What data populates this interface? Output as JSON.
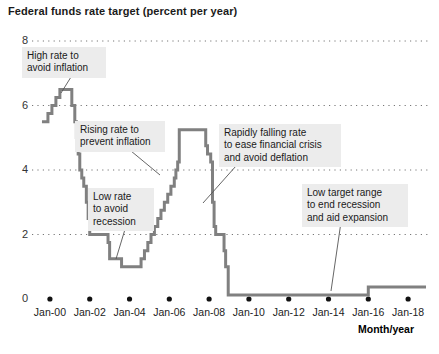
{
  "chart_data": {
    "type": "line",
    "title": "Federal funds rate target (percent per year)",
    "xlabel": "Month/year",
    "ylabel": "",
    "xlim": [
      "Jan-99",
      "Jan-19"
    ],
    "ylim": [
      0,
      8
    ],
    "grid": true,
    "grid_style": "dotted-horizontal",
    "legend": "none",
    "line_color": "#808080",
    "line_width": 3,
    "step": "post",
    "ytick_labels": [
      "0",
      "2",
      "4",
      "6",
      "8"
    ],
    "ytick_values": [
      0,
      2,
      4,
      6,
      8
    ],
    "xtick_labels": [
      "Jan-00",
      "Jan-02",
      "Jan-04",
      "Jan-06",
      "Jan-08",
      "Jan-10",
      "Jan-12",
      "Jan-14",
      "Jan-16",
      "Jan-18"
    ],
    "xtick_values": [
      2000,
      2002,
      2004,
      2006,
      2008,
      2010,
      2012,
      2014,
      2016,
      2018
    ],
    "series": [
      {
        "name": "Federal funds rate target",
        "x": [
          1999.6,
          1999.9,
          2000.1,
          2000.3,
          2000.5,
          2001.0,
          2001.1,
          2001.25,
          2001.33,
          2001.42,
          2001.5,
          2001.6,
          2001.7,
          2001.78,
          2001.83,
          2001.92,
          2002.0,
          2002.92,
          2003.0,
          2003.5,
          2003.6,
          2004.5,
          2004.58,
          2004.75,
          2004.92,
          2005.08,
          2005.25,
          2005.42,
          2005.58,
          2005.75,
          2005.92,
          2006.08,
          2006.25,
          2006.33,
          2006.42,
          2006.5,
          2007.67,
          2007.83,
          2007.92,
          2008.08,
          2008.17,
          2008.25,
          2008.33,
          2008.75,
          2008.83,
          2008.96,
          2015.96,
          2016.0,
          2018.9
        ],
        "y": [
          5.5,
          5.75,
          6.0,
          6.25,
          6.5,
          6.5,
          6.0,
          5.5,
          5.0,
          4.5,
          4.0,
          3.75,
          3.5,
          3.5,
          3.0,
          2.5,
          2.0,
          1.75,
          1.25,
          1.25,
          1.0,
          1.0,
          1.25,
          1.5,
          1.75,
          2.0,
          2.25,
          2.5,
          2.75,
          3.0,
          3.25,
          3.5,
          3.75,
          4.0,
          4.25,
          5.25,
          5.25,
          4.75,
          4.5,
          4.25,
          3.0,
          2.25,
          2.0,
          1.5,
          1.0,
          0.125,
          0.125,
          0.375,
          0.375
        ]
      }
    ],
    "annotations": [
      {
        "id": "high-rate",
        "lines": [
          "High rate to",
          "avoid inflation"
        ],
        "box_x": 22,
        "box_y": 47,
        "box_w": 74,
        "leader_from_x": 71,
        "leader_from_y": 77,
        "leader_to_x": 61,
        "leader_to_y": 93
      },
      {
        "id": "rising-rate",
        "lines": [
          "Rising rate to",
          "prevent inflation"
        ],
        "box_x": 75,
        "box_y": 121,
        "box_w": 80,
        "leader_from_x": 131,
        "leader_from_y": 151,
        "leader_to_x": 160,
        "leader_to_y": 175
      },
      {
        "id": "low-rate",
        "lines": [
          "Low rate",
          "to avoid",
          "recession"
        ],
        "box_x": 88,
        "box_y": 188,
        "box_w": 56,
        "leader_from_x": 126,
        "leader_from_y": 226,
        "leader_to_x": 116,
        "leader_to_y": 259
      },
      {
        "id": "rapidly-falling",
        "lines": [
          "Rapidly falling rate",
          "to ease financial crisis",
          "and avoid deflation"
        ],
        "box_x": 219,
        "box_y": 124,
        "box_w": 112,
        "leader_from_x": 236,
        "leader_from_y": 166,
        "leader_to_x": 203,
        "leader_to_y": 203
      },
      {
        "id": "low-target-range",
        "lines": [
          "Low target range",
          "to end recession",
          "and aid expansion"
        ],
        "box_x": 302,
        "box_y": 184,
        "box_w": 96,
        "leader_from_x": 341,
        "leader_from_y": 222,
        "leader_to_x": 331,
        "leader_to_y": 291
      }
    ]
  }
}
